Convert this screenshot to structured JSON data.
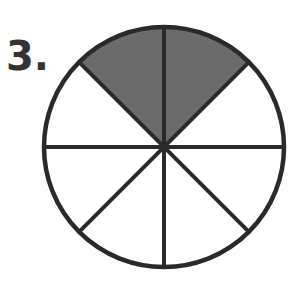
{
  "problem": {
    "number_label": "3."
  },
  "diagram": {
    "type": "fraction-circle",
    "total_parts": 8,
    "shaded_parts": 2,
    "shaded_positions": [
      "top-left",
      "top-right"
    ],
    "colors": {
      "stroke": "#2a2a2a",
      "shade": "#6b6b6b",
      "background": "#ffffff"
    }
  }
}
